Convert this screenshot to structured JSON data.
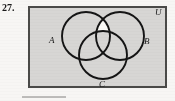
{
  "figure": {
    "problem_number": "27.",
    "universe_label": "U",
    "set_labels": [
      "A",
      "B",
      "C"
    ],
    "label_A": "A",
    "label_B": "B",
    "label_C": "C",
    "colors": {
      "page_background": "#f7f6f4",
      "universe_fill": "#d7d6d4",
      "shaded_region_fill": "#faf9f6",
      "stroke": "#151515",
      "border": "#4a4a48",
      "footer_rule": "#bdbcba"
    },
    "geometry": {
      "rect": {
        "x": 2,
        "y": 2,
        "width": 137,
        "height": 80
      },
      "circle_A": {
        "cx": 59,
        "cy": 31,
        "r": 24
      },
      "circle_B": {
        "cx": 93,
        "cy": 31,
        "r": 24
      },
      "circle_C": {
        "cx": 76,
        "cy": 50,
        "r": 24
      }
    },
    "shaded_description": "Region inside both A and B but outside C"
  }
}
